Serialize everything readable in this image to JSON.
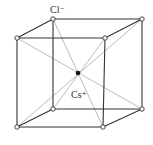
{
  "diagram": {
    "type": "crystal-unit-cell",
    "structure": "CsCl",
    "labels": {
      "anion": "Cl⁻",
      "cation": "Cs⁺"
    },
    "colors": {
      "edge": "#333333",
      "diagonal": "#aaaaaa",
      "corner_atom_fill": "#ffffff",
      "corner_atom_stroke": "#333333",
      "center_atom": "#111111",
      "label": "#333333"
    },
    "corners": {
      "back_top_left": [
        53,
        19
      ],
      "back_top_right": [
        142,
        19
      ],
      "back_bottom_left": [
        53,
        109
      ],
      "back_bottom_right": [
        142,
        109
      ],
      "front_top_left": [
        17,
        38
      ],
      "front_top_right": [
        105,
        38
      ],
      "front_bottom_left": [
        17,
        127
      ],
      "front_bottom_right": [
        103,
        127
      ]
    },
    "center": [
      78,
      73
    ]
  }
}
